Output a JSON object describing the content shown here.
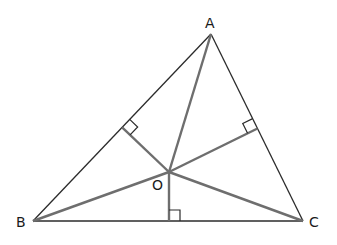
{
  "figure": {
    "vertices": [
      "A",
      "B",
      "C"
    ],
    "interior_point": "O",
    "segments_to_vertices": [
      "OA",
      "OB",
      "OC"
    ],
    "perpendiculars": [
      {
        "from": "O",
        "to_side": "AB",
        "right_angle_mark": true
      },
      {
        "from": "O",
        "to_side": "AC",
        "right_angle_mark": true
      },
      {
        "from": "O",
        "to_side": "BC",
        "right_angle_mark": true
      }
    ],
    "labels": {
      "A": "A",
      "B": "B",
      "C": "C",
      "O": "O"
    },
    "colors": {
      "triangle": "#2b2b2b",
      "inner_segments": "#6e6e6e",
      "text": "#1a1a1a"
    }
  }
}
